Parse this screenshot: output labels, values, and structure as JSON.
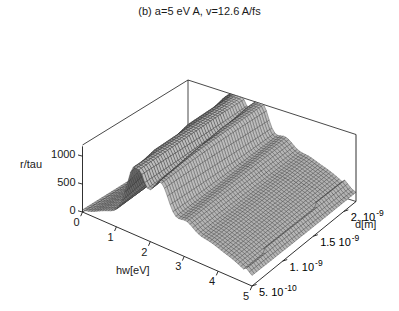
{
  "title": "(b) a=5 eV A, v=12.6 A/fs",
  "axes": {
    "z": {
      "label": "r/tau",
      "ticks": [
        "1000",
        "500",
        "0"
      ],
      "values": [
        1000,
        500,
        0
      ],
      "range": [
        0,
        1200
      ]
    },
    "x": {
      "label": "hw[eV]",
      "ticks": [
        "0",
        "1",
        "2",
        "3",
        "4",
        "5"
      ],
      "values": [
        0,
        1,
        2,
        3,
        4,
        5
      ],
      "range": [
        0,
        5
      ]
    },
    "y": {
      "label": "d[m]",
      "ticks": [
        {
          "mantissa": "5.",
          "base": "10",
          "exponent": "-10",
          "value": 5e-10
        },
        {
          "mantissa": "1.",
          "base": "10",
          "exponent": "-9",
          "value": 1e-09
        },
        {
          "mantissa": "1.5",
          "base": "10",
          "exponent": "-9",
          "value": 1.5e-09
        },
        {
          "mantissa": "2.",
          "base": "10",
          "exponent": "-9",
          "value": 2e-09
        }
      ],
      "range": [
        5e-10,
        2.2e-09
      ]
    }
  },
  "colors": {
    "frame": "#1a1a1a",
    "mesh_line": "#2b2b2b",
    "surface_light": "#b9b9b9",
    "surface_dark": "#3f3f3f",
    "background": "#ffffff",
    "text": "#1a1a1a"
  },
  "chart_data": {
    "type": "surface",
    "title": "(b) a=5 eV A, v=12.6 A/fs",
    "xlabel": "hw[eV]",
    "ylabel": "d[m]",
    "zlabel": "r/tau",
    "xlim": [
      0,
      5
    ],
    "ylim": [
      5e-10,
      2.2e-09
    ],
    "zlim": [
      0,
      1200
    ],
    "grid": false,
    "legend": "none",
    "x_tick_labels": [
      "0",
      "1",
      "2",
      "3",
      "4",
      "5"
    ],
    "y_tick_labels": [
      "5. 10^-10",
      "1. 10^-9",
      "1.5 10^-9",
      "2. 10^-9"
    ],
    "z_tick_labels": [
      "0",
      "500",
      "1000"
    ],
    "peaks": [
      {
        "hw": 1.5,
        "r_tau": 1150
      },
      {
        "hw": 2.22,
        "r_tau": 1060
      },
      {
        "hw": 2.95,
        "r_tau": 520
      },
      {
        "hw": 3.58,
        "r_tau": 300
      },
      {
        "hw": 4.1,
        "r_tau": 180
      },
      {
        "hw": 4.55,
        "r_tau": 110
      }
    ],
    "baseline_shelf": 120,
    "mesh": {
      "nx": 60,
      "ny": 44
    }
  }
}
